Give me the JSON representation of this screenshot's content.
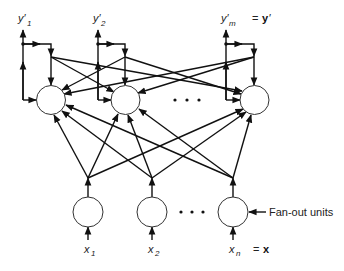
{
  "diagram": {
    "type": "neural-network-schematic",
    "output_layer": {
      "nodes": [
        {
          "id": "out1",
          "label": "y′",
          "subscript": "1"
        },
        {
          "id": "out2",
          "label": "y′",
          "subscript": "2"
        },
        {
          "id": "outm",
          "label": "y′",
          "subscript": "m"
        }
      ],
      "ellipsis": "• • •",
      "vector_eq": "=",
      "vector_symbol": "y",
      "vector_prime": "′"
    },
    "input_layer": {
      "nodes": [
        {
          "id": "in1",
          "label": "x",
          "subscript": "1"
        },
        {
          "id": "in2",
          "label": "x",
          "subscript": "2"
        },
        {
          "id": "inn",
          "label": "x",
          "subscript": "n"
        }
      ],
      "ellipsis": "• • •",
      "vector_eq": "=",
      "vector_symbol": "x",
      "annotation": "Fan-out units"
    },
    "connections": {
      "feedforward": "each fan-out unit connects to every output unit",
      "feedback": "each output unit feeds back to itself and to every other output unit"
    }
  }
}
